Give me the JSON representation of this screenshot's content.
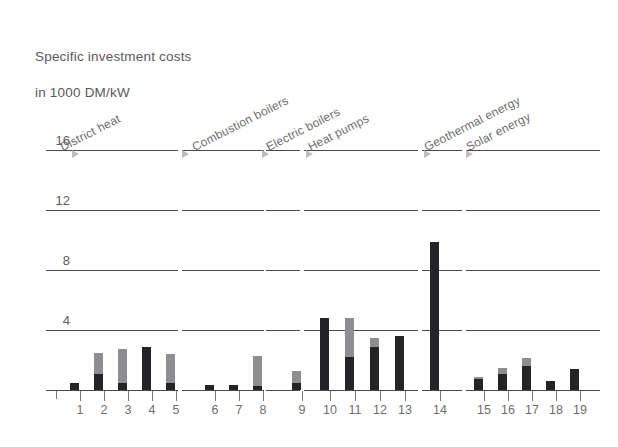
{
  "title": {
    "line1": "Specific investment costs",
    "line2": "in 1000 DM/kW"
  },
  "chart_data": {
    "type": "bar",
    "title": "Specific investment costs in 1000 DM/kW",
    "xlabel": "",
    "ylabel": "in 1000 DM/kW",
    "ylim": [
      0,
      17
    ],
    "yticks": [
      4,
      8,
      12,
      16
    ],
    "ytick_labels": [
      "4",
      "8",
      "12",
      "16"
    ],
    "grid": true,
    "grid_style": "horizontal gridlines broken per category group",
    "legend": null,
    "stacked": true,
    "categories": [
      "1",
      "2",
      "3",
      "4",
      "5",
      "6",
      "7",
      "8",
      "9",
      "10",
      "11",
      "12",
      "13",
      "14",
      "15",
      "16",
      "17",
      "18",
      "19"
    ],
    "series": [
      {
        "name": "lower-segment",
        "color": "#242426",
        "values": [
          0.5,
          1.1,
          0.45,
          2.9,
          0.5,
          0.35,
          0.35,
          0.25,
          0.5,
          4.8,
          2.2,
          2.9,
          3.6,
          9.9,
          0.75,
          1.1,
          1.6,
          0.6,
          1.4
        ]
      },
      {
        "name": "upper-segment",
        "color": "#8e8e90",
        "values": [
          0.0,
          1.4,
          2.3,
          0.0,
          1.9,
          0.0,
          0.0,
          2.05,
          0.8,
          0.0,
          2.6,
          0.6,
          0.0,
          0.0,
          0.15,
          0.35,
          0.55,
          0.0,
          0.0
        ]
      }
    ],
    "totals": [
      0.5,
      2.5,
      2.75,
      2.9,
      2.4,
      0.35,
      0.35,
      2.3,
      1.3,
      4.8,
      4.8,
      3.5,
      3.6,
      9.9,
      0.9,
      1.45,
      2.15,
      0.6,
      1.4
    ],
    "groups": [
      {
        "label": "District heat",
        "bars": [
          "1",
          "2",
          "3",
          "4",
          "5"
        ]
      },
      {
        "label": "Combustion boilers",
        "bars": [
          "6",
          "7",
          "8"
        ]
      },
      {
        "label": "Electric boilers",
        "bars": [
          "9"
        ]
      },
      {
        "label": "Heat pumps",
        "bars": [
          "10",
          "11",
          "12",
          "13"
        ]
      },
      {
        "label": "Geothermal energy",
        "bars": [
          "14"
        ]
      },
      {
        "label": "Solar energy",
        "bars": [
          "15",
          "16",
          "17",
          "18",
          "19"
        ]
      }
    ]
  },
  "colors": {
    "bar_dark": "#242426",
    "bar_gray": "#8e8e90",
    "axis": "#4a4a4c",
    "text": "#5c5c5e",
    "marker": "#bdbdbf"
  }
}
